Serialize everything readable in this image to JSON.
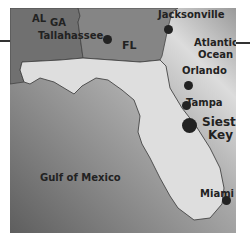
{
  "map": {
    "title": "Florida map showing Siesta Key",
    "colors": {
      "water_dark": "#6e6e6e",
      "water_light": "#d8d8d8",
      "florida": "#dedede",
      "neighbor_states": "#7a7a7a",
      "border": "#444444",
      "text": "#222222"
    },
    "states": [
      {
        "name": "AL",
        "label": "AL"
      },
      {
        "name": "GA",
        "label": "GA"
      },
      {
        "name": "FL",
        "label": "FL"
      }
    ],
    "water_bodies": [
      {
        "name": "atlantic",
        "label_line1": "Atlantic",
        "label_line2": "Ocean"
      },
      {
        "name": "gulf",
        "label": "Gulf of Mexico"
      }
    ],
    "cities": [
      {
        "name": "Tallahassee",
        "label": "Tallahassee"
      },
      {
        "name": "Jacksonville",
        "label": "Jacksonville"
      },
      {
        "name": "Orlando",
        "label": "Orlando"
      },
      {
        "name": "Tampa",
        "label": "Tampa"
      },
      {
        "name": "Siesta Key",
        "label_line1": "Siesta",
        "label_line2": "Key",
        "highlighted": true
      },
      {
        "name": "Miami",
        "label": "Miami"
      }
    ]
  }
}
